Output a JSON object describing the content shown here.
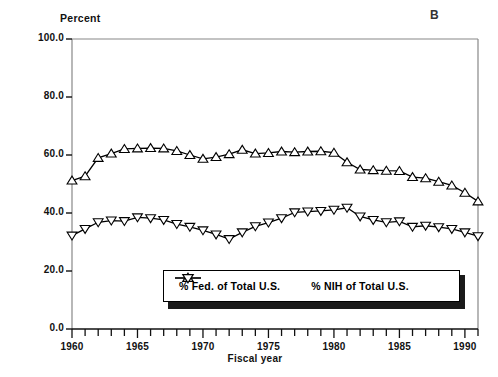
{
  "panel": {
    "label": "B"
  },
  "chart_data": {
    "type": "line",
    "title": "",
    "panel_label": "B",
    "ylabel": "Percent",
    "xlabel": "Fiscal year",
    "ylim": [
      0.0,
      100.0
    ],
    "xlim": [
      1960,
      1991
    ],
    "ytick_labels": [
      "100.0",
      "80.0",
      "60.0",
      "40.0",
      "20.0",
      "0.0"
    ],
    "ytick_values": [
      100.0,
      80.0,
      60.0,
      40.0,
      20.0,
      0.0
    ],
    "xtick_labels": [
      "1960",
      "1965",
      "1970",
      "1975",
      "1980",
      "1985",
      "1990"
    ],
    "xtick_values": [
      1960,
      1965,
      1970,
      1975,
      1980,
      1985,
      1990
    ],
    "x_minor_tick_step": 1,
    "grid": false,
    "legend_position": "inside-bottom-center",
    "x": [
      1960,
      1961,
      1962,
      1963,
      1964,
      1965,
      1966,
      1967,
      1968,
      1969,
      1970,
      1971,
      1972,
      1973,
      1974,
      1975,
      1976,
      1977,
      1978,
      1979,
      1980,
      1981,
      1982,
      1983,
      1984,
      1985,
      1986,
      1987,
      1988,
      1989,
      1990,
      1991
    ],
    "series": [
      {
        "name": "% Fed. of Total U.S.",
        "marker": "triangle-up",
        "values": [
          51.2,
          52.7,
          59.0,
          60.5,
          62.1,
          62.3,
          62.4,
          62.3,
          61.4,
          60.0,
          58.7,
          59.3,
          60.3,
          61.8,
          60.5,
          60.7,
          61.2,
          61.0,
          61.2,
          61.3,
          60.8,
          57.5,
          55.0,
          54.8,
          54.6,
          54.5,
          52.4,
          52.0,
          50.8,
          49.5,
          47.0,
          44.0
        ]
      },
      {
        "name": "% NIH of Total U.S.",
        "marker": "triangle-down",
        "values": [
          32.2,
          34.5,
          36.8,
          37.4,
          37.2,
          38.5,
          38.2,
          37.6,
          36.2,
          35.2,
          34.0,
          32.6,
          31.0,
          33.3,
          35.4,
          36.7,
          38.2,
          40.2,
          40.5,
          40.7,
          41.1,
          41.8,
          38.8,
          37.6,
          36.8,
          37.1,
          35.2,
          35.6,
          35.1,
          34.5,
          33.3,
          32.0
        ]
      }
    ]
  },
  "legend": {
    "items": [
      {
        "label": "% Fed. of Total U.S.",
        "marker": "triangle-up"
      },
      {
        "label": "% NIH of Total U.S.",
        "marker": "triangle-down"
      }
    ]
  }
}
